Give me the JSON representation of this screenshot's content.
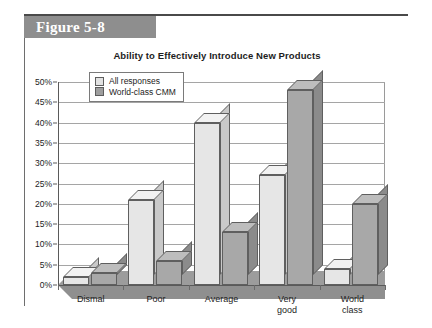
{
  "figure": {
    "label": "Figure 5-8"
  },
  "chart_data": {
    "type": "bar",
    "title": "Ability to Effectively Introduce New Products",
    "xlabel": "",
    "ylabel": "",
    "ylim": [
      0,
      50
    ],
    "ytick_labels": [
      "0%",
      "5%",
      "10%",
      "15%",
      "20%",
      "25%",
      "30%",
      "35%",
      "40%",
      "45%",
      "50%"
    ],
    "ytick_values": [
      0,
      5,
      10,
      15,
      20,
      25,
      30,
      35,
      40,
      45,
      50
    ],
    "grid": true,
    "legend_position": "top-left",
    "categories": [
      "Dismal",
      "Poor",
      "Average",
      "Very\ngood",
      "World\nclass"
    ],
    "series": [
      {
        "name": "All responses",
        "color": "#e6e6e6",
        "values": [
          2,
          21,
          40,
          27,
          4
        ]
      },
      {
        "name": "World-class CMM",
        "color": "#a8a8a8",
        "values": [
          3,
          6,
          13,
          48,
          20
        ]
      }
    ]
  }
}
